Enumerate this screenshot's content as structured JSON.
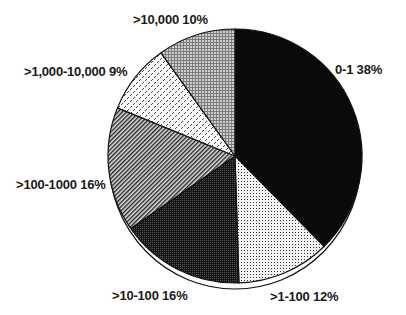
{
  "chart_data": {
    "type": "pie",
    "title": "",
    "start_angle_deg": 0,
    "direction": "clockwise",
    "slices": [
      {
        "label": "0-1",
        "value": 38,
        "display": "0-1 38%",
        "fill": "solid-black"
      },
      {
        "label": ">1-100",
        "value": 12,
        "display": ">1-100 12%",
        "fill": "fine-dots-light"
      },
      {
        "label": ">10-100",
        "value": 16,
        "display": ">10-100 16%",
        "fill": "dense-dark-checker"
      },
      {
        "label": ">100-1000",
        "value": 16,
        "display": ">100-1000 16%",
        "fill": "diagonal-hatch"
      },
      {
        "label": ">1,000-10,000",
        "value": 9,
        "display": ">1,000-10,000 9%",
        "fill": "dashed-dots-light"
      },
      {
        "label": ">10,000",
        "value": 10,
        "display": ">10,000 10%",
        "fill": "grid-gray"
      }
    ],
    "categories": [
      ">10,000",
      ">1,000-10,000",
      ">100-1000",
      ">10-100",
      ">1-100",
      "0-1"
    ],
    "values": [
      10,
      9,
      16,
      16,
      12,
      38
    ],
    "legend": "none (inline slice labels)"
  },
  "labels": {
    "s0": "0-1 38%",
    "s1": ">1-100 12%",
    "s2": ">10-100 16%",
    "s3": ">100-1000 16%",
    "s4": ">1,000-10,000 9%",
    "s5": ">10,000 10%"
  },
  "colors": {
    "ink": "#0a0a0a",
    "background": "#ffffff"
  }
}
